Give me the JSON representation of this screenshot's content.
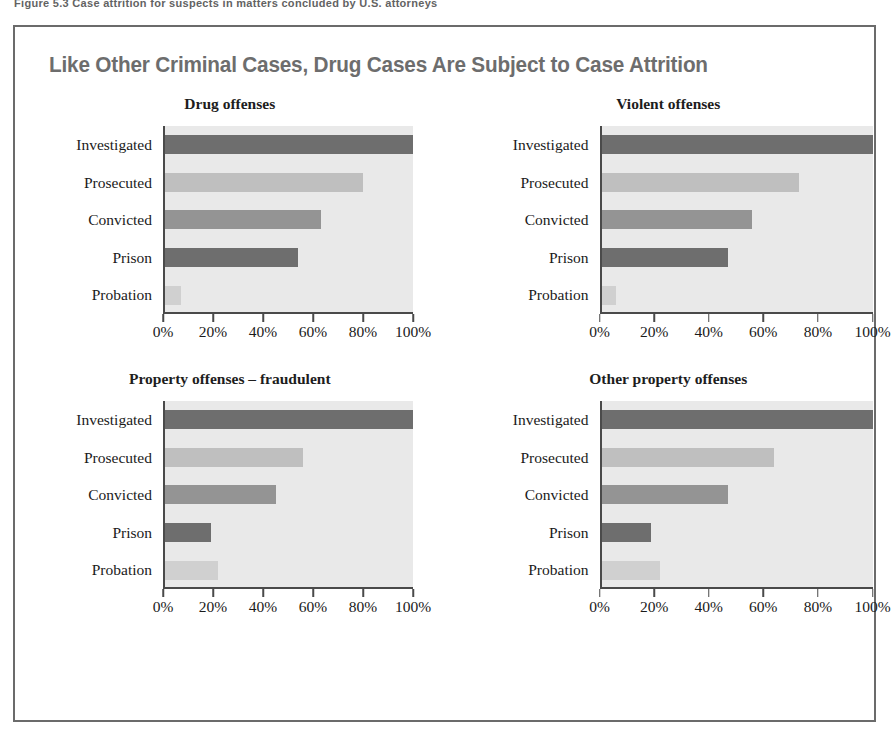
{
  "top_cut_text": "Figure 5.3  Case attrition for suspects in matters concluded by U.S. attorneys",
  "figure": {
    "title": "Like Other Criminal Cases, Drug Cases Are Subject to Case Attrition",
    "xaxis_caption": "Percentage of matters opened by U.S. attorneys",
    "frame_color": "#6b6b6b",
    "title_color": "#6d6d6d",
    "plot_background": "#e9e9e9"
  },
  "chart_data": {
    "type": "bar",
    "orientation": "horizontal",
    "title": "Like Other Criminal Cases, Drug Cases Are Subject to Case Attrition",
    "xlabel": "Percentage of matters opened by U.S. attorneys",
    "ylabel": "",
    "xlim": [
      0,
      100
    ],
    "xticks": [
      0,
      20,
      40,
      60,
      80,
      100
    ],
    "xticklabels": [
      "0%",
      "20%",
      "40%",
      "60%",
      "80%",
      "100%"
    ],
    "grid": false,
    "legend": "none",
    "categories": [
      "Investigated",
      "Prosecuted",
      "Convicted",
      "Prison",
      "Probation"
    ],
    "category_colors": [
      "#6e6e6e",
      "#bfbfbf",
      "#949494",
      "#6e6e6e",
      "#d0d0d0"
    ],
    "panels": [
      {
        "title": "Drug offenses",
        "values": [
          100,
          80,
          63,
          54,
          7
        ]
      },
      {
        "title": "Violent offenses",
        "values": [
          100,
          73,
          56,
          47,
          6
        ]
      },
      {
        "title": "Property offenses – fraudulent",
        "values": [
          100,
          56,
          45,
          19,
          22
        ]
      },
      {
        "title": "Other property offenses",
        "values": [
          100,
          64,
          47,
          19,
          22
        ]
      }
    ]
  }
}
